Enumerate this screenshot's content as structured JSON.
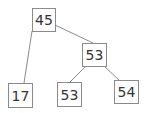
{
  "diagram": {
    "type": "tree",
    "nodes": [
      {
        "id": "n0",
        "label": "45",
        "x": 32,
        "y": 8,
        "w": 24,
        "h": 24
      },
      {
        "id": "n1",
        "label": "53",
        "x": 82,
        "y": 43,
        "w": 25,
        "h": 24
      },
      {
        "id": "n2",
        "label": "17",
        "x": 8,
        "y": 83,
        "w": 25,
        "h": 25
      },
      {
        "id": "n3",
        "label": "53",
        "x": 57,
        "y": 82,
        "w": 25,
        "h": 25
      },
      {
        "id": "n4",
        "label": "54",
        "x": 114,
        "y": 80,
        "w": 25,
        "h": 24
      }
    ],
    "edges": [
      {
        "from": "n0",
        "to": "n2"
      },
      {
        "from": "n0",
        "to": "n1"
      },
      {
        "from": "n1",
        "to": "n3"
      },
      {
        "from": "n1",
        "to": "n4"
      }
    ]
  }
}
